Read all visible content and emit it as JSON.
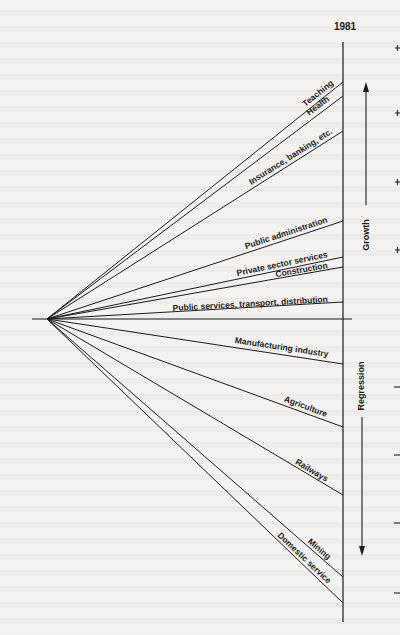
{
  "figure": {
    "year_label": "1981",
    "axis_labels": {
      "growth": "Growth",
      "regression": "Regression"
    },
    "origin": {
      "x": 47,
      "y": 319
    },
    "axis_x": 343,
    "colors": {
      "ink": "#1c1c1c",
      "paper": "#f4f3f1"
    },
    "sectors": [
      {
        "label": "Teaching",
        "end_y": 82,
        "direction": "growth"
      },
      {
        "label": "Health",
        "end_y": 96,
        "direction": "growth"
      },
      {
        "label": "Insurance, banking, etc.",
        "end_y": 131,
        "direction": "growth"
      },
      {
        "label": "Public administration",
        "end_y": 221,
        "direction": "growth"
      },
      {
        "label": "Private sector services",
        "end_y": 257,
        "direction": "growth"
      },
      {
        "label": "Construction",
        "end_y": 267,
        "direction": "growth"
      },
      {
        "label": "Public services, transport, distribution",
        "end_y": 302,
        "direction": "growth"
      },
      {
        "label": "Manufacturing industry",
        "end_y": 364,
        "direction": "regression"
      },
      {
        "label": "Agriculture",
        "end_y": 427,
        "direction": "regression"
      },
      {
        "label": "Railways",
        "end_y": 495,
        "direction": "regression"
      },
      {
        "label": "Mining",
        "end_y": 577,
        "direction": "regression"
      },
      {
        "label": "Domestic service",
        "end_y": 603,
        "direction": "regression"
      }
    ]
  }
}
